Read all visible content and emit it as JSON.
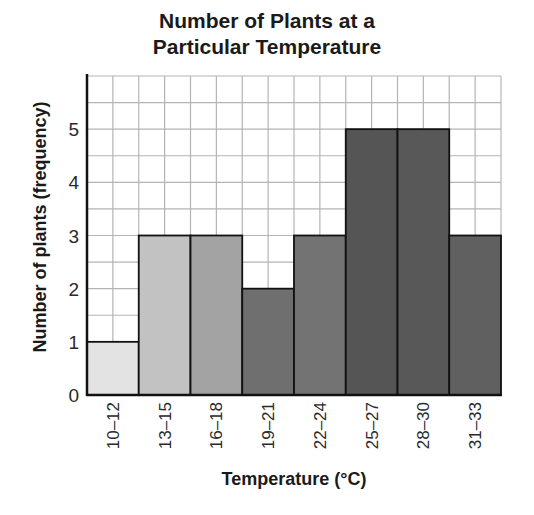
{
  "chart_data": {
    "type": "bar",
    "title": "Number of Plants at a Particular Temperature",
    "title_lines": [
      "Number of Plants at a",
      "Particular Temperature"
    ],
    "xlabel": "Temperature (°C)",
    "ylabel": "Number of plants (frequency)",
    "categories": [
      "10–12",
      "13–15",
      "16–18",
      "19–21",
      "22–24",
      "25–27",
      "28–30",
      "31–33"
    ],
    "values": [
      1,
      3,
      3,
      2,
      3,
      5,
      5,
      3
    ],
    "bar_colors": [
      "#e3e3e3",
      "#c2c2c2",
      "#a3a3a3",
      "#6f6f6f",
      "#737373",
      "#555555",
      "#585858",
      "#606060"
    ],
    "yticks": [
      0,
      1,
      2,
      3,
      4,
      5
    ],
    "ylim": [
      0,
      6
    ],
    "grid": true,
    "grid_step": 0.5,
    "legend": null
  }
}
